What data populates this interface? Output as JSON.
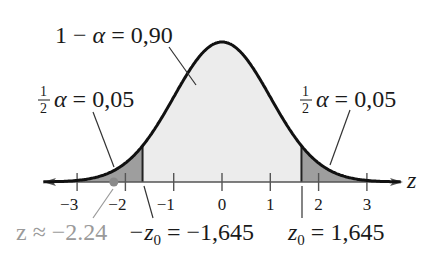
{
  "chart_data": {
    "type": "area",
    "title": "",
    "xlabel": "z",
    "ylabel": "",
    "xlim": [
      -3.7,
      3.7
    ],
    "ticks": [
      "-3",
      "-2",
      "-1",
      "0",
      "1",
      "2",
      "3"
    ],
    "tick_values": [
      -3,
      -2,
      -1,
      0,
      1,
      2,
      3
    ],
    "grid": false,
    "legend": null,
    "regions": [
      {
        "name": "left-tail",
        "from": -3.7,
        "to": -1.645,
        "area": 0.05,
        "fill": "#9e9e9e"
      },
      {
        "name": "center",
        "from": -1.645,
        "to": 1.645,
        "area": 0.9,
        "fill": "#ececec"
      },
      {
        "name": "right-tail",
        "from": 1.645,
        "to": 3.7,
        "area": 0.05,
        "fill": "#9e9e9e"
      }
    ],
    "critical_values": [
      -1.645,
      1.645
    ],
    "marked_point": {
      "z": -2.24,
      "color": "#8a8a8a"
    },
    "annotations": {
      "center": {
        "left": "1 − ",
        "alpha": "α",
        "right": " = 0,90"
      },
      "left_tail": {
        "num": "1",
        "den": "2",
        "alpha": "α",
        "right": " = 0,05"
      },
      "right_tail": {
        "num": "1",
        "den": "2",
        "alpha": "α",
        "right": " = 0,05"
      },
      "z_approx": "z ≈ −2.24",
      "neg_z0": {
        "prefix": "−z",
        "sub": "0",
        "value": " = −1,645"
      },
      "pos_z0": {
        "prefix": "z",
        "sub": "0",
        "value": " = 1,645"
      }
    }
  },
  "axis": {
    "label": "z"
  },
  "colors": {
    "curve": "#111111",
    "tail_fill": "#9e9e9e",
    "center_fill": "#ececec",
    "axis": "#555555",
    "gray_text": "#9a9a9a"
  }
}
